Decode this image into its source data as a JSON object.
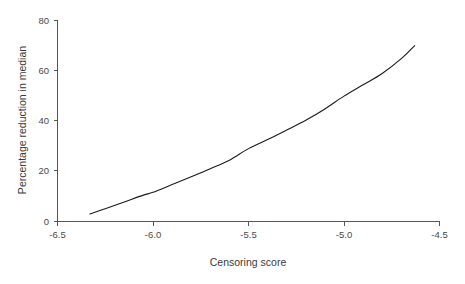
{
  "chart_data": {
    "type": "line",
    "title": "",
    "subtitle": "",
    "xlabel": "Censoring score",
    "ylabel": "Percentage reduction in median",
    "xlim": [
      -6.5,
      -4.5
    ],
    "ylim": [
      0,
      80
    ],
    "xticks": [
      -6.5,
      -6.0,
      -5.5,
      -5.0,
      -4.5
    ],
    "xtick_labels": [
      "-6.5",
      "-6.0",
      "-5.5",
      "-5.0",
      "-4.5"
    ],
    "yticks": [
      0,
      20,
      40,
      60,
      80
    ],
    "ytick_labels": [
      "0",
      "20",
      "40",
      "60",
      "80"
    ],
    "grid": false,
    "legend": null,
    "legend_position": "none",
    "annotations": [],
    "series": [
      {
        "name": "Percentage reduction in median",
        "color": "#1a1a1a",
        "x": [
          -6.33,
          -6.25,
          -6.15,
          -6.05,
          -6.0,
          -5.9,
          -5.8,
          -5.7,
          -5.6,
          -5.5,
          -5.4,
          -5.3,
          -5.2,
          -5.1,
          -5.0,
          -4.9,
          -4.8,
          -4.7,
          -4.63
        ],
        "y": [
          3.0,
          5.1,
          7.8,
          10.5,
          11.6,
          14.7,
          17.8,
          21.0,
          24.4,
          29.0,
          32.6,
          36.4,
          40.3,
          44.8,
          49.9,
          54.4,
          58.9,
          64.8,
          70.0
        ]
      }
    ]
  },
  "figure": {
    "background_color": "#ffffff",
    "axis_color": "#555555",
    "text_color": "#3a3a3a",
    "curve_color": "#1a1a1a"
  }
}
